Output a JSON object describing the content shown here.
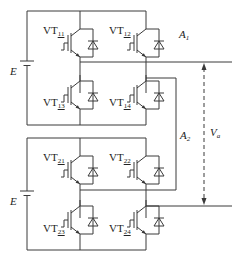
{
  "diagram": {
    "type": "circuit-schematic",
    "colors": {
      "wire": "#3a3a3a",
      "background": "#ffffff",
      "text": "#222222"
    },
    "modules": [
      {
        "name": "A1",
        "source": "E",
        "switches": [
          {
            "id": "VT11",
            "label_main": "VT",
            "label_sub": "11",
            "position": "upper-left"
          },
          {
            "id": "VT12",
            "label_main": "VT",
            "label_sub": "12",
            "position": "upper-right"
          },
          {
            "id": "VT13",
            "label_main": "VT",
            "label_sub": "13",
            "position": "lower-left"
          },
          {
            "id": "VT14",
            "label_main": "VT",
            "label_sub": "14",
            "position": "lower-right"
          }
        ]
      },
      {
        "name": "A2",
        "source": "E",
        "switches": [
          {
            "id": "VT21",
            "label_main": "VT",
            "label_sub": "21",
            "position": "upper-left"
          },
          {
            "id": "VT22",
            "label_main": "VT",
            "label_sub": "22",
            "position": "upper-right"
          },
          {
            "id": "VT23",
            "label_main": "VT",
            "label_sub": "23",
            "position": "lower-left"
          },
          {
            "id": "VT24",
            "label_main": "VT",
            "label_sub": "24",
            "position": "lower-right"
          }
        ]
      }
    ],
    "labels": {
      "e_top": "E",
      "e_bottom": "E",
      "a1": "A",
      "a1_sub": "1",
      "a2": "A",
      "a2_sub": "2",
      "va": "V",
      "va_sub": "a"
    },
    "output": {
      "name": "Va",
      "arrow": "dashed, bidirectional"
    }
  }
}
